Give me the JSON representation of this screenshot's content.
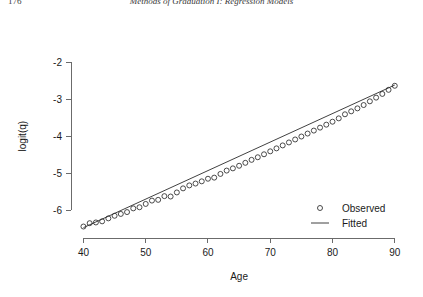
{
  "page": {
    "number": "176",
    "running_head": "Methods of Graduation I: Regression Models"
  },
  "chart_data": {
    "type": "scatter",
    "title": "",
    "xlabel": "Age",
    "ylabel": "logit(q)",
    "xlim": [
      38,
      91
    ],
    "ylim": [
      -6.75,
      -1.35
    ],
    "xticks": [
      40,
      50,
      60,
      70,
      80,
      90
    ],
    "xtick_labels": [
      "40",
      "50",
      "60",
      "70",
      "80",
      "90"
    ],
    "yticks": [
      -2,
      -3,
      -4,
      -5,
      -6
    ],
    "ytick_labels": [
      "-2",
      "-3",
      "-4",
      "-5",
      "-6"
    ],
    "grid": false,
    "legend_position": "bottom-right",
    "legend": [
      {
        "label": "Observed",
        "marker": "open-circle"
      },
      {
        "label": "Fitted",
        "marker": "line"
      }
    ],
    "series": [
      {
        "name": "Observed",
        "marker": "open-circle",
        "x": [
          40,
          41,
          42,
          43,
          44,
          45,
          46,
          47,
          48,
          49,
          50,
          51,
          52,
          53,
          54,
          55,
          56,
          57,
          58,
          59,
          60,
          61,
          62,
          63,
          64,
          65,
          66,
          67,
          68,
          69,
          70,
          71,
          72,
          73,
          74,
          75,
          76,
          77,
          78,
          79,
          80,
          81,
          82,
          83,
          84,
          85,
          86,
          87,
          88,
          89,
          90
        ],
        "y": [
          -6.44,
          -6.35,
          -6.33,
          -6.3,
          -6.22,
          -6.15,
          -6.1,
          -6.05,
          -5.95,
          -5.92,
          -5.83,
          -5.74,
          -5.72,
          -5.62,
          -5.63,
          -5.52,
          -5.41,
          -5.33,
          -5.28,
          -5.22,
          -5.15,
          -5.12,
          -5.02,
          -4.93,
          -4.87,
          -4.8,
          -4.72,
          -4.64,
          -4.57,
          -4.49,
          -4.41,
          -4.33,
          -4.25,
          -4.17,
          -4.09,
          -4.01,
          -3.93,
          -3.85,
          -3.77,
          -3.69,
          -3.61,
          -3.52,
          -3.41,
          -3.33,
          -3.25,
          -3.16,
          -3.06,
          -2.96,
          -2.86,
          -2.75,
          -2.64
        ]
      },
      {
        "name": "Fitted",
        "marker": "line",
        "x": [
          40,
          90
        ],
        "y": [
          -6.47,
          -2.62
        ]
      }
    ]
  }
}
